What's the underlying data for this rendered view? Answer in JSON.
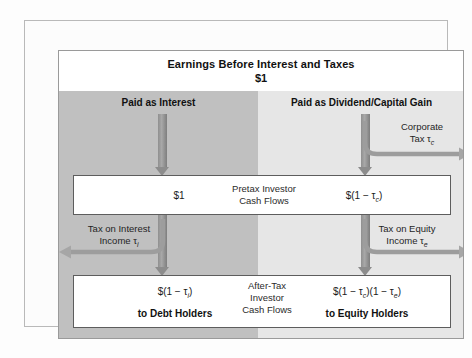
{
  "figure": {
    "title": "Earnings Before Interest and Taxes",
    "title_amount": "$1",
    "columns": {
      "left_heading": "Paid as Interest",
      "right_heading": "Paid as Dividend/Capital Gain"
    },
    "pretax_box": {
      "left_value": "$1",
      "center_label_line1": "Pretax Investor",
      "center_label_line2": "Cash Flows",
      "right_value": "$(1 − τc)"
    },
    "aftertax_box": {
      "left_value": "$(1 − τi)",
      "left_recipient": "to Debt Holders",
      "center_label_line1": "After-Tax",
      "center_label_line2": "Investor",
      "center_label_line3": "Cash Flows",
      "right_value": "$(1 − τc)(1 − τe)",
      "right_recipient": "to Equity Holders"
    },
    "side_labels": {
      "corporate_tax_line1": "Corporate",
      "corporate_tax_line2": "Tax τc",
      "interest_tax_line1": "Tax on Interest",
      "interest_tax_line2": "Income τi",
      "equity_tax_line1": "Tax on Equity",
      "equity_tax_line2": "Income τe"
    },
    "symbols": {
      "tau": "τ",
      "sub_c": "c",
      "sub_i": "i",
      "sub_e": "e",
      "minus": "−",
      "dollar": "$"
    },
    "colors": {
      "band_left": "#c0c0c0",
      "band_right": "#e6e6e6",
      "band_top": "#ffffff",
      "arrow": "#8c8c8c",
      "box_border": "#5d5d5d",
      "frame_border": "#9a9a9a",
      "text": "#111111"
    }
  }
}
